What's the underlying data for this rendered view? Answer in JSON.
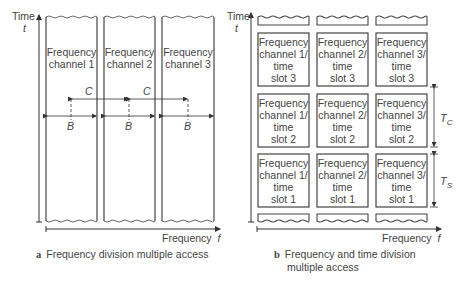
{
  "panel_a": {
    "y_axis_label": "Time",
    "y_axis_symbol": "t",
    "x_axis_label": "Frequency",
    "x_axis_symbol": "f",
    "channels": [
      "Frequency channel 1",
      "Frequency channel 2",
      "Frequency channel 3"
    ],
    "channel_lines": [
      [
        "Frequency",
        "channel 1"
      ],
      [
        "Frequency",
        "channel 2"
      ],
      [
        "Frequency",
        "channel 3"
      ]
    ],
    "spacing_label": "C",
    "bandwidth_label": "B",
    "caption_letter": "a",
    "caption": "Frequency division multiple access"
  },
  "panel_b": {
    "y_axis_label": "Time",
    "y_axis_symbol": "t",
    "x_axis_label": "Frequency",
    "x_axis_symbol": "f",
    "rows": [
      [
        [
          "Frequency",
          "channel 1/",
          "time",
          "slot 3"
        ],
        [
          "Frequency",
          "channel 2/",
          "time",
          "slot 3"
        ],
        [
          "Frequency",
          "channel 3/",
          "time",
          "slot 3"
        ]
      ],
      [
        [
          "Frequency",
          "channel 1/",
          "time",
          "slot 2"
        ],
        [
          "Frequency",
          "channel 2/",
          "time",
          "slot 2"
        ],
        [
          "Frequency",
          "channel 3/",
          "time",
          "slot 2"
        ]
      ],
      [
        [
          "Frequency",
          "channel 1/",
          "time",
          "slot 1"
        ],
        [
          "Frequency",
          "channel 2/",
          "time",
          "slot 1"
        ],
        [
          "Frequency",
          "channel 3/",
          "time",
          "slot 1"
        ]
      ]
    ],
    "tc_label": "T",
    "tc_sub": "C",
    "ts_label": "T",
    "ts_sub": "S",
    "caption_letter": "b",
    "caption_line1": "Frequency and time division",
    "caption_line2": "multiple access"
  }
}
